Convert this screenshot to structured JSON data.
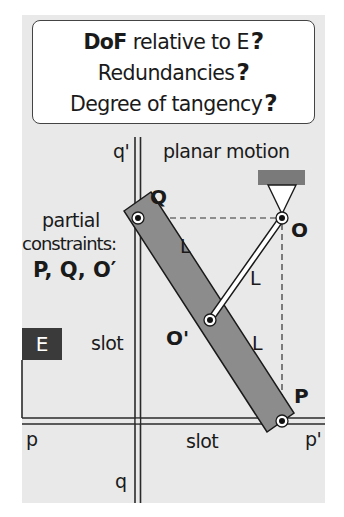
{
  "title_box": {
    "line1_bold": "DoF",
    "line1_rest": " relative to E",
    "line2": "Redundancies",
    "line3": "Degree of tangency",
    "question_mark": "?"
  },
  "labels": {
    "q_prime": "q'",
    "planar_motion": "planar motion",
    "partial": "partial",
    "constraints": "constraints:",
    "constraint_points": "P, Q, O′",
    "Q": "Q",
    "O": "O",
    "O_prime": "O'",
    "P": "P",
    "L1": "L",
    "L2": "L",
    "L3": "L",
    "E": "E",
    "slot_left": "slot",
    "slot_bottom": "slot",
    "p": "p",
    "p_prime": "p'",
    "q": "q"
  },
  "colors": {
    "background": "#e9e9e9",
    "bar": "#8c8c8c",
    "ground": "#7a7a7a",
    "e_box": "#3a3a3a"
  }
}
